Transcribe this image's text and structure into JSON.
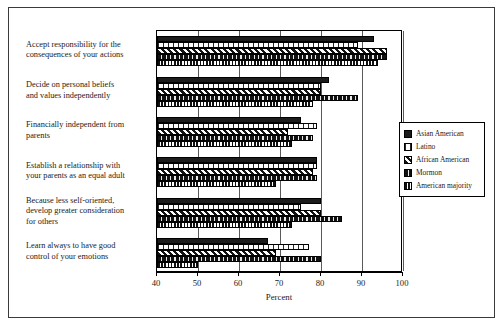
{
  "chart_data": {
    "type": "bar",
    "orientation": "horizontal",
    "title": "",
    "xlabel": "Percent",
    "ylabel": "",
    "xlim": [
      40,
      100
    ],
    "xticks": [
      40,
      50,
      60,
      70,
      80,
      90,
      100
    ],
    "grid": true,
    "legend_position": "right",
    "categories": [
      "Accept responsibility for the consequences of your actions",
      "Decide on personal beliefs and values independently",
      "Financially independent from parents",
      "Establish a relationship with your parents as an equal adult",
      "Because less self-oriented, develop greater consideration for others",
      "Learn always to have good control of your emotions"
    ],
    "category_lines": [
      [
        "Accept responsibility for the",
        "consequences of your actions"
      ],
      [
        "Decide on personal beliefs",
        "and values independently"
      ],
      [
        "Financially independent from",
        "parents"
      ],
      [
        "Establish a relationship with",
        "your parents as an equal adult"
      ],
      [
        "Because less self-oriented,",
        "develop greater consideration",
        "for others"
      ],
      [
        "Learn always to have good",
        "control of your emotions"
      ]
    ],
    "series": [
      {
        "name": "Asian American",
        "key": "asian",
        "pattern": "solid-black",
        "values": [
          93,
          82,
          75,
          79,
          80,
          67
        ]
      },
      {
        "name": "Latino",
        "key": "latino",
        "pattern": "fine-dot-white",
        "values": [
          89,
          80,
          79,
          79,
          75,
          77
        ]
      },
      {
        "name": "African American",
        "key": "african",
        "pattern": "diagonal-hatch",
        "values": [
          96,
          80,
          72,
          78,
          80,
          69
        ]
      },
      {
        "name": "Mormon",
        "key": "mormon",
        "pattern": "dense-dark-dash",
        "values": [
          96,
          89,
          78,
          79,
          85,
          80
        ]
      },
      {
        "name": "American majority",
        "key": "majority",
        "pattern": "vertical-stripes",
        "values": [
          94,
          78,
          73,
          69,
          73,
          50
        ]
      }
    ]
  },
  "legend": {
    "items": [
      {
        "label": "Asian American"
      },
      {
        "label": "Latino"
      },
      {
        "label": "African American"
      },
      {
        "label": "Mormon"
      },
      {
        "label": "American majority"
      }
    ]
  }
}
